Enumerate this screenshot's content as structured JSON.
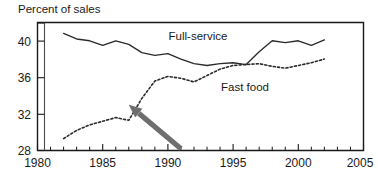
{
  "chart_data": {
    "type": "line",
    "title": "Percent of sales",
    "xlabel": "",
    "ylabel": "Percent of sales",
    "xlim": [
      1980,
      2005
    ],
    "ylim": [
      28,
      42
    ],
    "grid": false,
    "legend_position": "inline-annotation",
    "y_ticks": [
      28,
      32,
      36,
      40
    ],
    "y_tick_labels": [
      "28",
      "32",
      "36",
      "40"
    ],
    "x_ticks": [
      1980,
      1985,
      1990,
      1995,
      2000,
      2005
    ],
    "x_tick_labels": [
      "1980",
      "1985",
      "1990",
      "1995",
      "2000",
      "2005"
    ],
    "x_minor_tick_interval": 1,
    "axis_break_after": 1980,
    "x": [
      1982,
      1983,
      1984,
      1985,
      1986,
      1987,
      1988,
      1989,
      1990,
      1991,
      1992,
      1993,
      1994,
      1995,
      1996,
      1997,
      1998,
      1999,
      2000,
      2001,
      2002
    ],
    "series": [
      {
        "name": "Full-service",
        "style": "solid",
        "color": "#2b2b2b",
        "label": "Full-service",
        "values": [
          40.8,
          40.2,
          40.0,
          39.5,
          40.0,
          39.6,
          38.7,
          38.4,
          38.6,
          38.0,
          37.5,
          37.3,
          37.5,
          37.6,
          37.4,
          38.8,
          40.0,
          39.8,
          40.0,
          39.5,
          40.1
        ]
      },
      {
        "name": "Fast food",
        "style": "dotted",
        "color": "#2b2b2b",
        "label": "Fast food",
        "values": [
          29.3,
          30.2,
          30.8,
          31.2,
          31.6,
          31.3,
          33.7,
          35.6,
          36.1,
          35.9,
          35.5,
          36.2,
          36.9,
          37.3,
          37.4,
          37.5,
          37.2,
          37.0,
          37.3,
          37.6,
          38.0
        ]
      }
    ],
    "annotations": [
      {
        "name": "arrow",
        "kind": "arrow",
        "color": "#6e6e6e",
        "points_to_year": 1987,
        "points_to_value": 33.0,
        "tail_year": 1991,
        "tail_value": 28.2
      },
      {
        "name": "full-service-label",
        "kind": "text",
        "text": "Full-service",
        "year": 1993,
        "value": 40.5
      },
      {
        "name": "fast-food-label",
        "kind": "text",
        "text": "Fast food",
        "year": 1994,
        "value": 34.2
      }
    ]
  },
  "axis_title": {
    "text": "Percent of sales"
  },
  "series_labels": {
    "full_service": "Full-service",
    "fast_food": "Fast food"
  },
  "y_axis": {
    "labels": [
      "40",
      "36",
      "32",
      "28"
    ]
  },
  "x_axis": {
    "labels": [
      "1980",
      "1985",
      "1990",
      "1995",
      "2000",
      "2005"
    ]
  }
}
